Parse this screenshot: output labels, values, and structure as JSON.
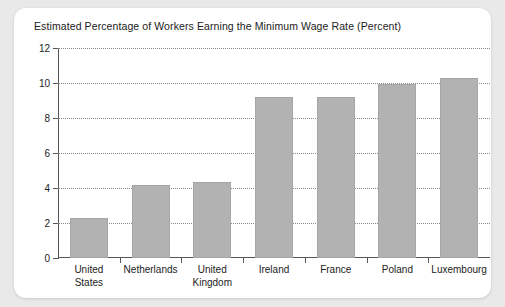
{
  "chart_data": {
    "type": "bar",
    "title": "Estimated Percentage of Workers Earning the Minimum Wage Rate (Percent)",
    "xlabel": "",
    "ylabel": "",
    "categories": [
      "United States",
      "Netherlands",
      "United Kingdom",
      "Ireland",
      "France",
      "Poland",
      "Luxembourg"
    ],
    "category_lines": [
      [
        "United",
        "States"
      ],
      [
        "Netherlands"
      ],
      [
        "United",
        "Kingdom"
      ],
      [
        "Ireland"
      ],
      [
        "France"
      ],
      [
        "Poland"
      ],
      [
        "Luxembourg"
      ]
    ],
    "values": [
      2.3,
      4.2,
      4.35,
      9.2,
      9.2,
      9.95,
      10.3
    ],
    "ylim": [
      0,
      12
    ],
    "yticks": [
      0,
      2,
      4,
      6,
      8,
      10,
      12
    ],
    "ytick_labels": [
      "0",
      "2",
      "4",
      "6",
      "8",
      "10",
      "12"
    ],
    "grid": true,
    "grid_style": "dotted",
    "legend": "none",
    "bar_color": "#b2b2b2",
    "axis_color": "#555555",
    "background_color": "#ffffff",
    "page_background_color": "#e9e9e9"
  }
}
